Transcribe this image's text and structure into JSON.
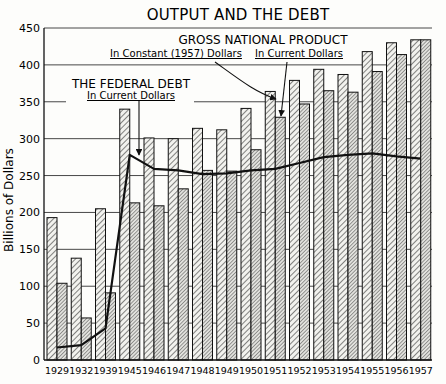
{
  "chart_data": {
    "type": "bar",
    "title": "OUTPUT AND THE DEBT",
    "xlabel": "",
    "ylabel": "Billions of Dollars",
    "ylim": [
      0,
      450
    ],
    "yticks": [
      0,
      50,
      100,
      150,
      200,
      250,
      300,
      350,
      400,
      450
    ],
    "grid": true,
    "categories": [
      "1929",
      "1932",
      "1939",
      "1945",
      "1946",
      "1947",
      "1948",
      "1949",
      "1950",
      "1951",
      "1952",
      "1953",
      "1954",
      "1955",
      "1956",
      "1957"
    ],
    "series": [
      {
        "name": "Gross National Product In Constant (1957) Dollars",
        "kind": "bar",
        "values": [
          193,
          138,
          205,
          340,
          301,
          300,
          314,
          312,
          341,
          364,
          379,
          394,
          387,
          418,
          430,
          434
        ]
      },
      {
        "name": "Gross National Product In Current Dollars",
        "kind": "bar",
        "values": [
          104,
          57,
          91,
          213,
          209,
          232,
          257,
          256,
          285,
          329,
          347,
          365,
          363,
          391,
          414,
          434
        ]
      },
      {
        "name": "The Federal Debt In Current Dollars",
        "kind": "line",
        "values": [
          17,
          20,
          43,
          278,
          259,
          257,
          252,
          253,
          257,
          259,
          267,
          275,
          278,
          280,
          276,
          273
        ]
      }
    ],
    "annotations": [
      {
        "text": "GROSS NATIONAL PRODUCT",
        "role": "group-heading"
      },
      {
        "text": "In Constant (1957) Dollars",
        "points_to": "1951 constant bar"
      },
      {
        "text": "In Current Dollars",
        "points_to": "1951 current bar"
      },
      {
        "text": "THE FEDERAL DEBT",
        "role": "line-heading"
      },
      {
        "text": "In Current Dollars",
        "points_to": "debt line at 1945"
      }
    ]
  },
  "labels": {
    "title": "OUTPUT AND THE DEBT",
    "ylabel": "Billions of Dollars",
    "gnp_heading": "GROSS NATIONAL PRODUCT",
    "gnp_constant": "In Constant (1957) Dollars",
    "gnp_current": "In Current Dollars",
    "debt_heading": "THE FEDERAL DEBT",
    "debt_current": "In Current Dollars"
  },
  "colors": {
    "ink": "#111111",
    "background": "#fdfdfb",
    "bar_fill": "#e6e6e2"
  }
}
